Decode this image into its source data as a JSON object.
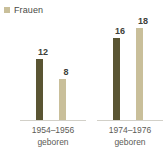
{
  "legend": {
    "position": "top-left",
    "entries": [
      {
        "label": "Frauen",
        "marker": "legend-swatch-square",
        "color": "#c9bf9a"
      }
    ]
  },
  "colors": {
    "series_dark": "#5a5533",
    "series_light": "#c9bf9a",
    "baseline": "#d2d0c8",
    "value_text": "#403f3a",
    "caption_text": "#5c5b56",
    "background": "#ffffff"
  },
  "chart_data": {
    "type": "bar",
    "title": "",
    "subtitle": "",
    "xlabel": "",
    "ylabel": "",
    "ylim": [
      0,
      20
    ],
    "grid": false,
    "legend_position": "top-left",
    "categories": [
      "1954–1956\ngeboren",
      "1974–1976\ngeboren"
    ],
    "series": [
      {
        "name": "dunkel",
        "color": "#5a5533",
        "values": [
          12,
          16
        ]
      },
      {
        "name": "Frauen",
        "color": "#c9bf9a",
        "values": [
          8,
          18
        ]
      }
    ],
    "groups": [
      {
        "caption_line1": "1954–1956",
        "caption_line2": "geboren",
        "bars": [
          {
            "value": 12,
            "label": "12",
            "color": "#5a5533"
          },
          {
            "value": 8,
            "label": "8",
            "color": "#c9bf9a"
          }
        ]
      },
      {
        "caption_line1": "1974–1976",
        "caption_line2": "geboren",
        "bars": [
          {
            "value": 16,
            "label": "16",
            "color": "#5a5533"
          },
          {
            "value": 18,
            "label": "18",
            "color": "#c9bf9a"
          }
        ]
      }
    ]
  }
}
